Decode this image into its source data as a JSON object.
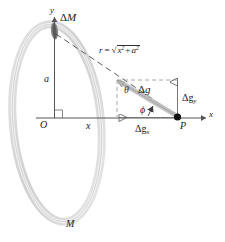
{
  "figure": {
    "name": "gravitational-field-of-ring-diagram"
  },
  "axes": {
    "y_label": "y",
    "x_label": "x",
    "origin_label": "O",
    "right_angle_marker": true
  },
  "ring": {
    "mass_label": "M",
    "element_label": "ΔM",
    "radius_label": "a",
    "color": "#d2d2d2",
    "element_color": "#6e6e6e"
  },
  "distances": {
    "x_label": "x",
    "r_label": "r",
    "r_equals": "=",
    "r_radicand_x": "x",
    "r_exp_x": "2",
    "r_plus": "+",
    "r_radicand_a": "a",
    "r_exp_a": "2"
  },
  "point": {
    "label": "P"
  },
  "vectors": {
    "resultant": "Δg",
    "y_component_delta": "Δg",
    "y_component_sub": "y",
    "x_component_delta": "Δg",
    "x_component_sub": "x",
    "angle_theta": "θ",
    "angle_phi": "ϕ",
    "vector_color": "#b8b8b8",
    "dash_color": "#9a9aa5"
  },
  "colors": {
    "line": "#555555",
    "text": "#1a1a1a",
    "background": "#ffffff"
  }
}
